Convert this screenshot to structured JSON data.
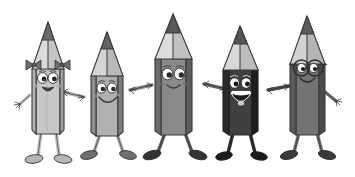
{
  "illustration": {
    "title": "Five cartoon pencil characters holding hands",
    "background_color": "#ffffff",
    "width": 355,
    "height": 177,
    "style": "grayscale cartoon clip-art"
  },
  "palette": {
    "background": "#ffffff",
    "outline": "#3a3a3a",
    "graphite_tip": "#5e5e5e",
    "graphite_tip_dark": "#4a4a4a",
    "eye_white": "#ffffff",
    "pupil": "#2b2b2b",
    "mouth_dark": "#3d3d3d",
    "tongue": "#c9c9c9",
    "shoe_light": "#b0b0b0",
    "shoe_dark": "#2f2f2f"
  },
  "characters": [
    {
      "id": "pencil-1",
      "name": "light-gray-pencil-with-bows",
      "order": 1,
      "body_front_color": "#c7c7c7",
      "body_side_color": "#b2b2b2",
      "body_shadow_color": "#a0a0a0",
      "wood_color": "#dcdcdc",
      "wood_side_color": "#c4c4c4",
      "tip_color": "#6a6a6a",
      "limb_color": "#c0c0c0",
      "shoe_color": "#b6b6b6",
      "accessory": "hair-bows",
      "accessory_color": "#6f6f6f",
      "expression": "smiling",
      "mouth": "open-smile",
      "has_glasses": false,
      "has_bows": true,
      "height_rank": 5,
      "arm_left": "raised-free",
      "arm_right": "holding-hands"
    },
    {
      "id": "pencil-2",
      "name": "medium-gray-pencil",
      "order": 2,
      "body_front_color": "#b0b0b0",
      "body_side_color": "#8f8f8f",
      "body_shadow_color": "#7e7e7e",
      "wood_color": "#d4d4d4",
      "wood_side_color": "#b8b8b8",
      "tip_color": "#646464",
      "limb_color": "#a8a8a8",
      "shoe_color": "#6f6f6f",
      "accessory": "none",
      "accessory_color": "",
      "expression": "smiling",
      "mouth": "wide-smile",
      "has_glasses": false,
      "has_bows": false,
      "height_rank": 4,
      "arm_left": "holding-hands",
      "arm_right": "holding-hands"
    },
    {
      "id": "pencil-3",
      "name": "dark-gray-tall-pencil",
      "order": 3,
      "body_front_color": "#8a8a8a",
      "body_side_color": "#6b6b6b",
      "body_shadow_color": "#5c5c5c",
      "wood_color": "#dcdcdc",
      "wood_side_color": "#c0c0c0",
      "tip_color": "#5a5a5a",
      "limb_color": "#5a5a5a",
      "shoe_color": "#333333",
      "accessory": "none",
      "accessory_color": "",
      "expression": "smiling",
      "mouth": "small-smile",
      "has_glasses": false,
      "has_bows": false,
      "height_rank": 1,
      "arm_left": "holding-hands",
      "arm_right": "holding-hands"
    },
    {
      "id": "pencil-4",
      "name": "black-pencil-laughing",
      "order": 4,
      "body_front_color": "#3f3f3f",
      "body_side_color": "#2a2a2a",
      "body_shadow_color": "#1f1f1f",
      "wood_color": "#d8d8d8",
      "wood_side_color": "#bdbdbd",
      "tip_color": "#555555",
      "limb_color": "#2b2b2b",
      "shoe_color": "#1c1c1c",
      "accessory": "none",
      "accessory_color": "",
      "expression": "laughing",
      "mouth": "open-laugh",
      "has_glasses": false,
      "has_bows": false,
      "height_rank": 3,
      "arm_left": "holding-hands",
      "arm_right": "holding-hands"
    },
    {
      "id": "pencil-5",
      "name": "gray-pencil-with-glasses",
      "order": 5,
      "body_front_color": "#737373",
      "body_side_color": "#595959",
      "body_shadow_color": "#4a4a4a",
      "wood_color": "#d2d2d2",
      "wood_side_color": "#b5b5b5",
      "tip_color": "#5c5c5c",
      "limb_color": "#6a6a6a",
      "shoe_color": "#3a3a3a",
      "accessory": "round-glasses",
      "accessory_color": "#2e2e2e",
      "expression": "smiling",
      "mouth": "smile",
      "has_glasses": true,
      "has_bows": false,
      "height_rank": 2,
      "arm_left": "holding-hands",
      "arm_right": "raised-free"
    }
  ]
}
